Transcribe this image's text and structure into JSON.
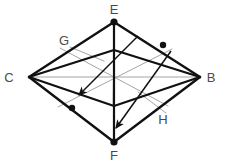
{
  "figure": {
    "kind": "geometry-diagram",
    "background_color": "#ffffff",
    "stroke_color_primary": "#111111",
    "stroke_color_secondary": "#9a9a9a",
    "label_color": "#4a4a4a",
    "labels": [
      {
        "id": "label-E-top",
        "text": "E",
        "x": 114,
        "y": 12
      },
      {
        "id": "label-G",
        "text": "G",
        "x": 64,
        "y": 42
      },
      {
        "id": "label-C-left",
        "text": "C",
        "x": 9,
        "y": 80
      },
      {
        "id": "label-B-right",
        "text": "B",
        "x": 211,
        "y": 80
      },
      {
        "id": "label-H",
        "text": "H",
        "x": 163,
        "y": 120
      },
      {
        "id": "label-F-bottom",
        "text": "F",
        "x": 114,
        "y": 157
      }
    ],
    "vertices": [
      {
        "id": "vertex-E",
        "name": "E",
        "x": 114,
        "y": 21,
        "dot": true
      },
      {
        "id": "vertex-C",
        "name": "C",
        "x": 29,
        "y": 77,
        "dot": false
      },
      {
        "id": "vertex-B",
        "name": "B",
        "x": 200,
        "y": 77,
        "dot": false
      },
      {
        "id": "vertex-F",
        "name": "F",
        "x": 114,
        "y": 142,
        "dot": true
      },
      {
        "id": "vertex-inner-top",
        "name": "G'",
        "x": 114,
        "y": 50,
        "dot": false
      },
      {
        "id": "vertex-inner-bottom",
        "name": "H'",
        "x": 114,
        "y": 106,
        "dot": false
      },
      {
        "id": "vertex-center",
        "name": "O",
        "x": 113,
        "y": 78,
        "dot": false
      }
    ],
    "point_markers": [
      {
        "id": "marker-on-EB",
        "x": 163,
        "y": 45,
        "r": 3.2
      },
      {
        "id": "marker-on-CF",
        "x": 72,
        "y": 108,
        "r": 3.2
      }
    ],
    "thick_edges": [
      {
        "id": "edge-E-C",
        "from": "E",
        "to": "C"
      },
      {
        "id": "edge-E-B",
        "from": "E",
        "to": "B"
      },
      {
        "id": "edge-C-F",
        "from": "C",
        "to": "F"
      },
      {
        "id": "edge-B-F",
        "from": "B",
        "to": "F"
      },
      {
        "id": "edge-E-F-vertical",
        "from": "E",
        "to": "F"
      },
      {
        "id": "edge-C-innerTop",
        "from": "C",
        "to": "innerTop"
      },
      {
        "id": "edge-innerTop-B",
        "from": "innerTop",
        "to": "B"
      },
      {
        "id": "edge-C-innerBottom",
        "from": "C",
        "to": "innerBottom"
      },
      {
        "id": "edge-innerBottom-B",
        "from": "innerBottom",
        "to": "B"
      }
    ],
    "thin_edges": [
      {
        "id": "thin-C-B-horizontal",
        "from": "C",
        "to": "B"
      },
      {
        "id": "thin-innerTop-center",
        "from": "innerTop",
        "to": "center"
      },
      {
        "id": "thin-innerBottom-center",
        "from": "innerBottom",
        "to": "center"
      },
      {
        "id": "thin-C-center-diag-up",
        "from": "C",
        "to": "innerTop"
      },
      {
        "id": "thin-center-B-diag-down",
        "from": "center",
        "to": "B"
      },
      {
        "id": "thin-G-leader",
        "from": "G",
        "to": "edge-midpoint"
      },
      {
        "id": "thin-H-leader",
        "from": "H",
        "to": "edge-midpoint"
      }
    ],
    "arrows": [
      {
        "id": "arrow-E-to-lowerleft",
        "x1": 137,
        "y1": 38,
        "x2": 78,
        "y2": 96
      },
      {
        "id": "arrow-B-to-F",
        "x1": 170,
        "y1": 52,
        "x2": 115,
        "y2": 129
      }
    ]
  }
}
